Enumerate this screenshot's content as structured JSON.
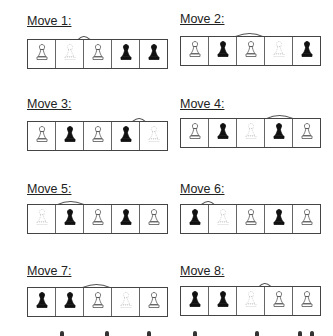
{
  "moves": [
    {
      "label": "Move 1:",
      "pawns": [
        "white",
        "ghost",
        "white",
        "black",
        "black"
      ],
      "arrow": {
        "from": 2,
        "to": 3
      }
    },
    {
      "label": "Move 2:",
      "pawns": [
        "white",
        "black",
        "white",
        "ghost",
        "black"
      ],
      "arrow": {
        "from": 4,
        "to": 2
      }
    },
    {
      "label": "Move 3:",
      "pawns": [
        "white",
        "black",
        "white",
        "black",
        "ghost"
      ],
      "arrow": {
        "from": 5,
        "to": 4
      }
    },
    {
      "label": "Move 4:",
      "pawns": [
        "white",
        "black",
        "ghost",
        "black",
        "white"
      ],
      "arrow": {
        "from": 3,
        "to": 5
      }
    },
    {
      "label": "Move 5:",
      "pawns": [
        "ghost",
        "black",
        "white",
        "black",
        "white"
      ],
      "arrow": {
        "from": 1,
        "to": 3
      }
    },
    {
      "label": "Move 6:",
      "pawns": [
        "black",
        "ghost",
        "white",
        "black",
        "white"
      ],
      "arrow": {
        "from": 2,
        "to": 1
      }
    },
    {
      "label": "Move 7:",
      "pawns": [
        "black",
        "black",
        "white",
        "ghost",
        "white"
      ],
      "arrow": {
        "from": 4,
        "to": 2
      }
    },
    {
      "label": "Move 8:",
      "pawns": [
        "black",
        "black",
        "ghost",
        "white",
        "white"
      ],
      "arrow": {
        "from": 3,
        "to": 4
      }
    }
  ],
  "icons": {
    "pawn": "pawn-icon",
    "arrow": "curved-arrow-icon"
  },
  "colors": {
    "black_pawn": "#111111",
    "white_pawn_outline": "#555555",
    "ghost_pawn": "#c8c8c8",
    "arrow": "#555555",
    "grid": "#555555"
  }
}
